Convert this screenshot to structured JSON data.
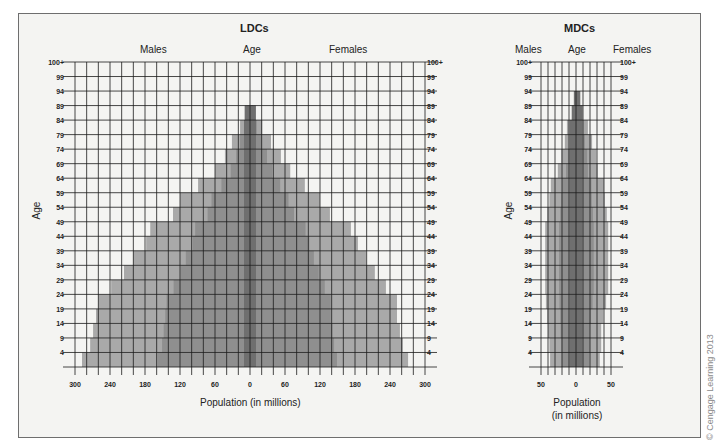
{
  "chart_data": [
    {
      "type": "bar",
      "subtype": "population-pyramid",
      "title": "LDCs",
      "left_header": "Males",
      "center_header": "Age",
      "right_header": "Females",
      "ylabel": "Age",
      "xlabel": "Population (in millions)",
      "x_ticks": [
        "300",
        "240",
        "180",
        "120",
        "60",
        "0",
        "60",
        "120",
        "180",
        "240",
        "300"
      ],
      "xlim": [
        -300,
        300
      ],
      "y_ticks": [
        "4",
        "9",
        "14",
        "19",
        "24",
        "29",
        "34",
        "39",
        "44",
        "49",
        "54",
        "59",
        "64",
        "69",
        "74",
        "79",
        "84",
        "89",
        "94",
        "99",
        "100+"
      ],
      "grid": true,
      "categories": [
        "0-4",
        "5-9",
        "10-14",
        "15-19",
        "20-24",
        "25-29",
        "30-34",
        "35-39",
        "40-44",
        "45-49",
        "50-54",
        "55-59",
        "60-64",
        "65-69",
        "70-74",
        "75-79",
        "80-84",
        "85-89",
        "90-94",
        "95-99",
        "100+"
      ],
      "series": [
        {
          "name": "Males",
          "values": [
            288,
            274,
            269,
            264,
            260,
            238,
            216,
            200,
            178,
            171,
            132,
            120,
            89,
            60,
            43,
            31,
            17,
            9,
            0,
            0,
            0
          ]
        },
        {
          "name": "Females",
          "values": [
            271,
            262,
            257,
            252,
            252,
            233,
            214,
            199,
            185,
            173,
            137,
            120,
            94,
            69,
            53,
            36,
            21,
            10,
            0,
            0,
            0
          ]
        }
      ]
    },
    {
      "type": "bar",
      "subtype": "population-pyramid",
      "title": "MDCs",
      "left_header": "Males",
      "center_header": "Age",
      "right_header": "Females",
      "ylabel": "Age",
      "xlabel": "Population\n(in millions)",
      "xlabel_lines": [
        "Population",
        "(in millions)"
      ],
      "x_ticks": [
        "50",
        "0",
        "50"
      ],
      "xlim": [
        -50,
        50
      ],
      "y_ticks": [
        "4",
        "9",
        "14",
        "19",
        "24",
        "29",
        "34",
        "39",
        "44",
        "49",
        "54",
        "59",
        "64",
        "69",
        "74",
        "79",
        "84",
        "89",
        "94",
        "99",
        "100+"
      ],
      "grid": true,
      "categories": [
        "0-4",
        "5-9",
        "10-14",
        "15-19",
        "20-24",
        "25-29",
        "30-34",
        "35-39",
        "40-44",
        "45-49",
        "50-54",
        "55-59",
        "60-64",
        "65-69",
        "70-74",
        "75-79",
        "80-84",
        "85-89",
        "90-94",
        "95-99",
        "100+"
      ],
      "series": [
        {
          "name": "Males",
          "values": [
            37,
            38,
            40,
            41,
            43,
            44,
            44,
            44,
            44,
            44,
            41,
            38,
            36,
            26,
            21,
            16,
            13,
            6,
            3,
            0,
            0
          ]
        },
        {
          "name": "Females",
          "values": [
            34,
            36,
            36,
            39,
            43,
            46,
            46,
            46,
            46,
            46,
            44,
            41,
            40,
            31,
            29,
            23,
            17,
            10,
            6,
            0,
            0
          ]
        }
      ]
    }
  ],
  "copyright": "© Cengage Learning 2013",
  "colors": {
    "frame_bg": "#f4f4f2",
    "grid": "#1a1a1a",
    "bar_outer": "#a9a9a9",
    "bar_mid": "#8f8f8f",
    "bar_inner": "#6f6f6f"
  }
}
